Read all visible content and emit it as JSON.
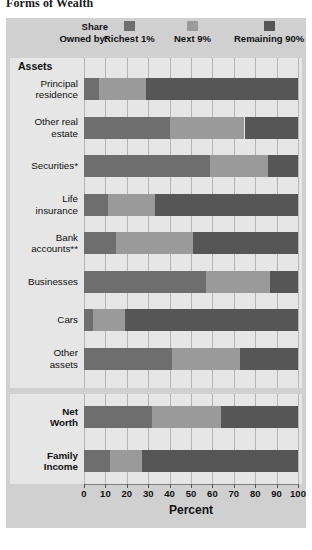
{
  "title": "Forms of Wealth",
  "legend": {
    "label_line1": "Share",
    "label_line2": "Owned by:",
    "items": [
      {
        "name": "Richest 1%",
        "color": "#6e6e6e"
      },
      {
        "name": "Next 9%",
        "color": "#9a9a9a"
      },
      {
        "name": "Remaining 90%",
        "color": "#565656"
      }
    ]
  },
  "groups": [
    {
      "header": "Assets"
    },
    {
      "header": ""
    }
  ],
  "axis": {
    "ticks": [
      "0",
      "10",
      "20",
      "30",
      "40",
      "50",
      "60",
      "70",
      "80",
      "90",
      "100"
    ],
    "xlabel": "Percent",
    "min": 0,
    "max": 100
  },
  "colors": {
    "panel_bg": "#d0d0d0",
    "group_bg": "#e6e6e6",
    "grid": "#b4b4b4",
    "richest1": "#6e6e6e",
    "next9": "#9a9a9a",
    "remaining90": "#565656",
    "text": "#111111"
  },
  "chart_data": {
    "type": "bar",
    "title": "Forms of Wealth",
    "xlabel": "Percent",
    "ylabel": "",
    "xlim": [
      0,
      100
    ],
    "grid": true,
    "orientation": "horizontal",
    "stacked": true,
    "legend_position": "top",
    "categories": [
      "Principal residence",
      "Other real estate",
      "Securities*",
      "Life insurance",
      "Bank accounts**",
      "Businesses",
      "Cars",
      "Other assets",
      "Net Worth",
      "Family Income"
    ],
    "series": [
      {
        "name": "Richest 1%",
        "values": [
          7,
          40,
          59,
          11,
          15,
          57,
          4,
          41,
          32,
          12
        ]
      },
      {
        "name": "Next 9%",
        "values": [
          22,
          35,
          27,
          22,
          36,
          30,
          15,
          32,
          32,
          15
        ]
      },
      {
        "name": "Remaining 90%",
        "values": [
          71,
          25,
          14,
          67,
          49,
          13,
          81,
          27,
          36,
          73
        ]
      }
    ]
  },
  "rows": [
    {
      "label_lines": [
        "Principal",
        "residence"
      ],
      "group": 0,
      "bold": false
    },
    {
      "label_lines": [
        "Other real",
        "estate"
      ],
      "group": 0,
      "bold": false
    },
    {
      "label_lines": [
        "Securities*"
      ],
      "group": 0,
      "bold": false
    },
    {
      "label_lines": [
        "Life",
        "insurance"
      ],
      "group": 0,
      "bold": false
    },
    {
      "label_lines": [
        "Bank",
        "accounts**"
      ],
      "group": 0,
      "bold": false
    },
    {
      "label_lines": [
        "Businesses"
      ],
      "group": 0,
      "bold": false
    },
    {
      "label_lines": [
        "Cars"
      ],
      "group": 0,
      "bold": false
    },
    {
      "label_lines": [
        "Other",
        "assets"
      ],
      "group": 0,
      "bold": false
    },
    {
      "label_lines": [
        "Net",
        "Worth"
      ],
      "group": 1,
      "bold": true
    },
    {
      "label_lines": [
        "Family",
        "Income"
      ],
      "group": 1,
      "bold": true
    }
  ]
}
